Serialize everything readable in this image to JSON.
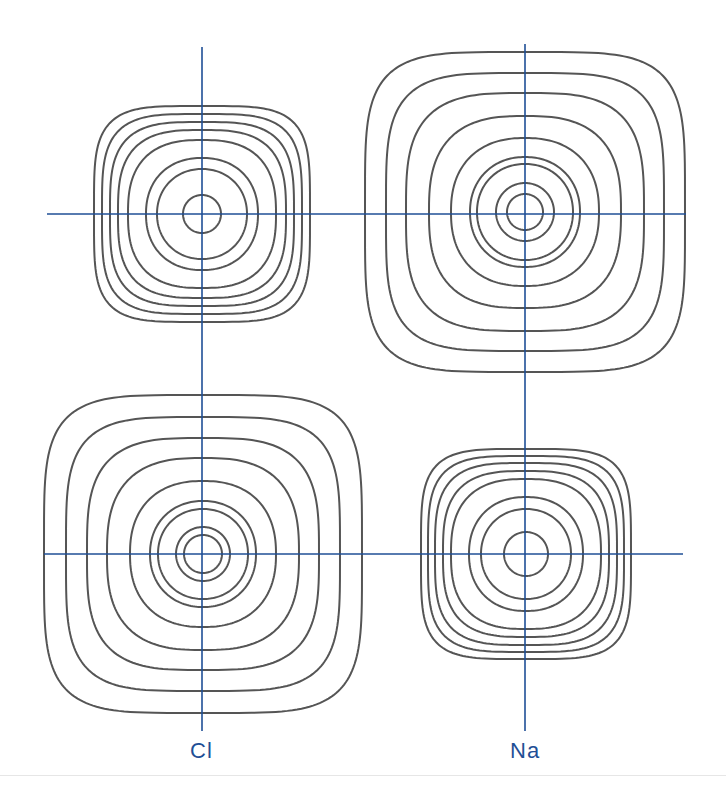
{
  "diagram": {
    "colors": {
      "axis": "#1f4f96",
      "contour": "#555555",
      "label": "#1f4f96",
      "background": "#ffffff"
    },
    "labels": {
      "cl": "Cl",
      "na": "Na"
    },
    "axes": {
      "vertical": [
        {
          "name": "cl-column-axis",
          "x": 202,
          "y1": 47,
          "y2": 731
        },
        {
          "name": "na-column-axis",
          "x": 525,
          "y1": 44,
          "y2": 731
        }
      ],
      "horizontal": [
        {
          "name": "top-row-axis",
          "y": 214,
          "x1": 47,
          "x2": 686
        },
        {
          "name": "bottom-row-axis",
          "y": 554,
          "x1": 44,
          "x2": 683
        }
      ]
    },
    "ions": [
      {
        "name": "top-left-small-ion",
        "cx": 202,
        "cy": 214,
        "radii": [
          108,
          100,
          92,
          84,
          74,
          56,
          45,
          19
        ],
        "squareness": [
          0.55,
          0.45,
          0.35,
          0.25,
          0.15,
          0.05,
          0.02,
          0
        ]
      },
      {
        "name": "top-right-large-ion",
        "cx": 525,
        "cy": 212,
        "radii": [
          160,
          139,
          119,
          96,
          74,
          55,
          48,
          29,
          18
        ],
        "squareness": [
          0.62,
          0.5,
          0.32,
          0.18,
          0.08,
          0.03,
          0.02,
          0,
          0
        ]
      },
      {
        "name": "bottom-left-large-ion",
        "cx": 203,
        "cy": 554,
        "radii": [
          159,
          137,
          116,
          96,
          73,
          53,
          45,
          27,
          19
        ],
        "squareness": [
          0.62,
          0.5,
          0.32,
          0.18,
          0.08,
          0.03,
          0.02,
          0,
          0
        ]
      },
      {
        "name": "bottom-right-small-ion",
        "cx": 526,
        "cy": 554,
        "radii": [
          105,
          98,
          91,
          83,
          75,
          57,
          45,
          22
        ],
        "squareness": [
          0.55,
          0.45,
          0.35,
          0.25,
          0.15,
          0.05,
          0.02,
          0
        ]
      }
    ]
  }
}
